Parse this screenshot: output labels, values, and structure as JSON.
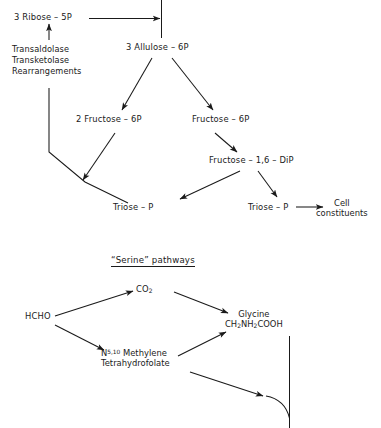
{
  "figure": {
    "background_color": "#ffffff",
    "ink_color": "#1a1a1a"
  },
  "pentose_cycle": {
    "nodes": {
      "ribose": "3 Ribose – 5P",
      "allulose": "3 Allulose – 6P",
      "fructose_2": "2 Fructose – 6P",
      "fructose_1": "Fructose – 6P",
      "fdp": "Fructose – 1,6 – DiP",
      "triose_left": "Triose – P",
      "triose_right": "Triose – P",
      "cell_constituents_line1": "Cell",
      "cell_constituents_line2": "constituents"
    },
    "enzyme_label": "Transaldolase\nTransketolase\nRearrangements"
  },
  "serine_pathways": {
    "title_quoted": "“Serine”",
    "title_rest": " pathways",
    "nodes": {
      "hcho": "HCHO",
      "co2_formula": "CO",
      "co2_sub": "2",
      "methylene_n": "N",
      "methylene_sup": "5,10",
      "methylene_rest": " Methylene",
      "methylene_line2": "Tetrahydrofolate",
      "glycine_name": "Glycine",
      "glycine_f1": "CH",
      "glycine_f1_sub": "2",
      "glycine_f2": "NH",
      "glycine_f2_sub": "2",
      "glycine_f3": "COOH"
    }
  }
}
